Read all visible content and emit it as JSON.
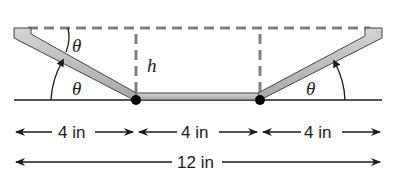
{
  "figure": {
    "type": "trough cross-section",
    "labels": {
      "theta_top_left": "θ",
      "theta_bottom_left": "θ",
      "theta_right": "θ",
      "height": "h"
    },
    "dimensions": {
      "segment_left": "4 in",
      "segment_middle": "4 in",
      "segment_right": "4 in",
      "total": "12 in"
    },
    "colors": {
      "board_fill": "#b8b8b8",
      "board_stroke": "#444444",
      "dashed_line": "#808080",
      "line": "#1a1a1a",
      "hinge": "#000000"
    }
  }
}
